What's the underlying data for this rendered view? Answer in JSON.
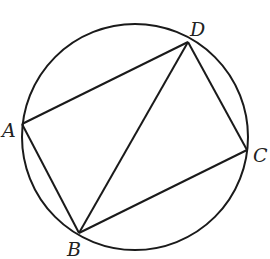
{
  "diagram": {
    "type": "inscribed-quadrilateral",
    "circle": {
      "cx": 135,
      "cy": 137,
      "r": 113
    },
    "points": {
      "A": {
        "x": 22,
        "y": 124,
        "label": "A"
      },
      "B": {
        "x": 79,
        "y": 233,
        "label": "B"
      },
      "C": {
        "x": 247,
        "y": 150,
        "label": "C"
      },
      "D": {
        "x": 188,
        "y": 42,
        "label": "D"
      }
    },
    "segments": [
      "AD",
      "DC",
      "CB",
      "BA",
      "BD"
    ],
    "stroke_color": "#1a1a1a"
  }
}
